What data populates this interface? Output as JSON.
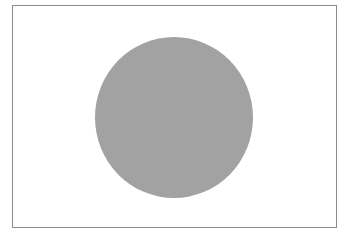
{
  "image": {
    "subject": "flag",
    "description": "Grayscale flag with central disc (Japan flag style)",
    "colors": {
      "background": "#ffffff",
      "field": "#ffffff",
      "border": "#8a8a8a",
      "disc": "#a2a2a2"
    }
  }
}
